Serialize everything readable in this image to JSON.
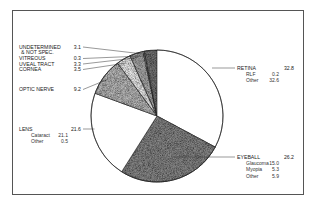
{
  "chart_data": {
    "type": "pie",
    "title": "",
    "unit": "percent",
    "start": "12 o'clock",
    "direction": "clockwise",
    "slices": [
      {
        "name": "RETINA",
        "value": 32.8,
        "fill": "#ffffff",
        "side": "right",
        "sub": [
          {
            "name": "RLF",
            "value": 0.2
          },
          {
            "name": "Other",
            "value": 32.6
          }
        ]
      },
      {
        "name": "EYEBALL",
        "value": 26.2,
        "fill": "#8a8a8a",
        "side": "right",
        "sub": [
          {
            "name": "Glaucoma",
            "value": 15.0
          },
          {
            "name": "Myopia",
            "value": 5.3
          },
          {
            "name": "Other",
            "value": 5.9
          }
        ]
      },
      {
        "name": "LENS",
        "value": 21.6,
        "fill": "#ffffff",
        "side": "left",
        "sub": [
          {
            "name": "Cataract",
            "value": 21.1
          },
          {
            "name": "Other",
            "value": 0.5
          }
        ]
      },
      {
        "name": "OPTIC NERVE",
        "value": 9.2,
        "fill": "#bdbdbd",
        "side": "left",
        "sub": []
      },
      {
        "name": "CORNEA",
        "value": 3.5,
        "fill": "#f2f2f2",
        "side": "left",
        "sub": []
      },
      {
        "name": "UVEAL TRACT",
        "value": 3.3,
        "fill": "#b0b0b0",
        "side": "left",
        "sub": []
      },
      {
        "name": "VITREOUS",
        "value": 0.3,
        "fill": "#e0e0e0",
        "side": "left",
        "sub": []
      },
      {
        "name": "UNDETERMINED\n& NOT SPEC.",
        "value": 3.1,
        "fill": "#777777",
        "side": "left",
        "sub": []
      }
    ]
  }
}
